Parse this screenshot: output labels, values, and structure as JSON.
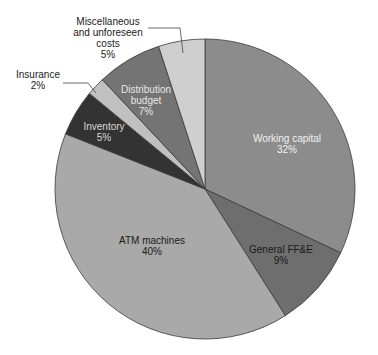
{
  "chart_data": {
    "type": "pie",
    "title": "",
    "start_angle_deg": 0,
    "direction": "clockwise",
    "slices": [
      {
        "label": "Working capital",
        "value": 32,
        "pct_label": "32%",
        "color": "#8c8c8c",
        "text_color": "#f2f2f2",
        "label_pos": [
          287,
          142
        ],
        "label_inside": true
      },
      {
        "label": "General FF&E",
        "value": 9,
        "pct_label": "9%",
        "color": "#6e6e6e",
        "text_color": "#1a1a1a",
        "label_pos": [
          281,
          253
        ],
        "label_inside": true
      },
      {
        "label": "ATM machines",
        "value": 40,
        "pct_label": "40%",
        "color": "#a9a9a9",
        "text_color": "#1a1a1a",
        "label_pos": [
          152,
          244
        ],
        "label_inside": true
      },
      {
        "label": "Inventory",
        "value": 5,
        "pct_label": "5%",
        "color": "#333333",
        "text_color": "#d8d8d8",
        "label_pos": [
          104,
          130
        ],
        "label_inside": true
      },
      {
        "label": "Insurance",
        "value": 2,
        "pct_label": "2%",
        "color": "#c0c0c0",
        "text_color": "#1a1a1a",
        "label_pos": [
          38,
          78
        ],
        "label_inside": false,
        "leader": [
          [
            63,
            83
          ],
          [
            88,
            83
          ],
          [
            96,
            93
          ]
        ]
      },
      {
        "label": "Distribution budget",
        "value": 7,
        "pct_label": "7%",
        "color": "#747474",
        "text_color": "#e6e6e6",
        "label_pos": [
          146,
          93
        ],
        "label_inside": true,
        "lines": [
          "Distribution",
          "budget"
        ]
      },
      {
        "label": "Miscellaneous and unforeseen costs",
        "value": 5,
        "pct_label": "5%",
        "color": "#cfcfcf",
        "text_color": "#1a1a1a",
        "label_pos": [
          108,
          25
        ],
        "label_inside": false,
        "lines": [
          "Miscellaneous",
          "and unforeseen",
          "costs"
        ],
        "leader": [
          [
            148,
            28
          ],
          [
            180,
            28
          ],
          [
            183,
            53
          ]
        ]
      }
    ],
    "center": [
      205,
      189
    ],
    "radius": 150,
    "stroke": "#3a3a3a"
  }
}
